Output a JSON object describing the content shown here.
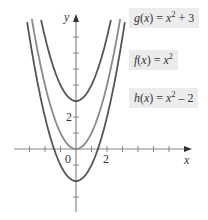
{
  "chart_data": {
    "type": "line",
    "title": "",
    "xlabel": "x",
    "ylabel": "y",
    "origin_label": "0",
    "x_tick_label": "2",
    "y_tick_label": "2",
    "xlim": [
      -3,
      7.3
    ],
    "ylim": [
      -4,
      6
    ],
    "grid": false,
    "series": [
      {
        "name": "g(x) = x^2 + 3",
        "shift": 3,
        "color": "#555555"
      },
      {
        "name": "f(x) = x^2",
        "shift": 0,
        "color": "#8a8a8a"
      },
      {
        "name": "h(x) = x^2 - 2",
        "shift": -2,
        "color": "#555555"
      }
    ]
  },
  "labels": {
    "g": {
      "name": "g",
      "var": "x",
      "base": "x",
      "exp": "2",
      "tail": " + 3"
    },
    "f": {
      "name": "f",
      "var": "x",
      "base": "x",
      "exp": "2",
      "tail": ""
    },
    "h": {
      "name": "h",
      "var": "x",
      "base": "x",
      "exp": "2",
      "tail": " – 2"
    }
  },
  "axis": {
    "x": "x",
    "y": "y",
    "origin": "0",
    "xtick": "2",
    "ytick": "2"
  }
}
